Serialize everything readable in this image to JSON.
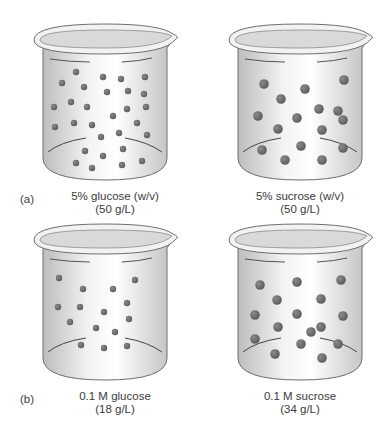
{
  "figure": {
    "parts": [
      {
        "id": "a",
        "part_label": "(a)",
        "beakers": [
          {
            "name": "glucose",
            "line1": "5% glucose (w/v)",
            "line2": "(50 g/L)",
            "particle_size": "small",
            "particle_count": 29
          },
          {
            "name": "sucrose",
            "line1": "5% sucrose (w/v)",
            "line2": "(50 g/L)",
            "particle_size": "large",
            "particle_count": 16
          }
        ]
      },
      {
        "id": "b",
        "part_label": "(b)",
        "beakers": [
          {
            "name": "glucose",
            "line1": "0.1 M glucose",
            "line2": "(18 g/L)",
            "particle_size": "small",
            "particle_count": 15
          },
          {
            "name": "sucrose",
            "line1": "0.1 M sucrose",
            "line2": "(34 g/L)",
            "particle_size": "large",
            "particle_count": 16
          }
        ]
      }
    ],
    "colors": {
      "particle": "#5a5a5a",
      "particle_highlight": "#8a8a8a",
      "beaker_outline": "#6e6e6e",
      "beaker_fill": "#e6e6e6"
    }
  }
}
